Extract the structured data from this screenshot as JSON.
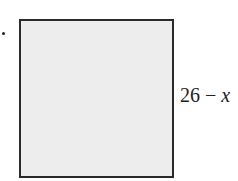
{
  "diagram": {
    "shape": "square",
    "fill_color": "#ededed",
    "border_color": "#2a2a2a",
    "side_label": {
      "number": "26",
      "operator": " − ",
      "variable": "x"
    }
  }
}
